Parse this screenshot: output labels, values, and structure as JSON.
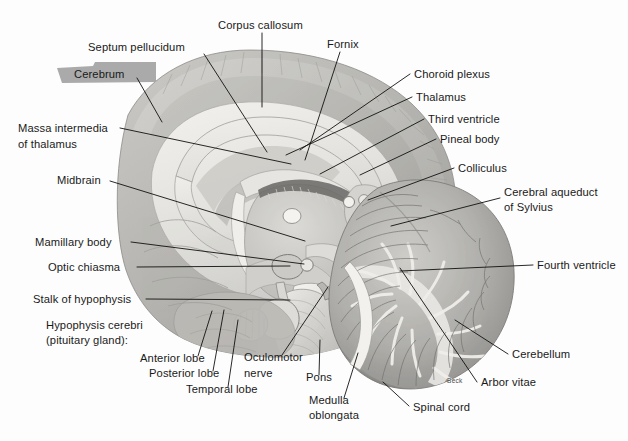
{
  "figure": {
    "signature": "Beck",
    "background_color": "#fdfdfd",
    "line_color": "#111111",
    "text_color": "#1a1a1a",
    "highlight_color": "#a9aaa9",
    "highlighted_label": "Cerebrum"
  },
  "labels": [
    {
      "id": "septum-pellucidum",
      "text": "Septum pellucidum",
      "x": 88,
      "y": 51,
      "anchor": "start"
    },
    {
      "id": "corpus-callosum",
      "text": "Corpus callosum",
      "x": 218,
      "y": 29,
      "anchor": "start"
    },
    {
      "id": "fornix",
      "text": "Fornix",
      "x": 327,
      "y": 48,
      "anchor": "start"
    },
    {
      "id": "cerebrum",
      "text": "Cerebrum",
      "x": 74,
      "y": 78,
      "anchor": "start"
    },
    {
      "id": "choroid-plexus",
      "text": "Choroid plexus",
      "x": 414,
      "y": 78,
      "anchor": "start"
    },
    {
      "id": "thalamus",
      "text": "Thalamus",
      "x": 416,
      "y": 101,
      "anchor": "start"
    },
    {
      "id": "third-ventricle",
      "text": "Third ventricle",
      "x": 428,
      "y": 123,
      "anchor": "start"
    },
    {
      "id": "pineal-body",
      "text": "Pineal body",
      "x": 440,
      "y": 143,
      "anchor": "start"
    },
    {
      "id": "massa-intermedia-1",
      "text": "Massa intermedia",
      "x": 18,
      "y": 132,
      "anchor": "start"
    },
    {
      "id": "massa-intermedia-2",
      "text": "of thalamus",
      "x": 18,
      "y": 148,
      "anchor": "start"
    },
    {
      "id": "colliculus",
      "text": "Colliculus",
      "x": 458,
      "y": 172,
      "anchor": "start"
    },
    {
      "id": "midbrain",
      "text": "Midbrain",
      "x": 57,
      "y": 184,
      "anchor": "start"
    },
    {
      "id": "cerebral-aqueduct-1",
      "text": "Cerebral aqueduct",
      "x": 504,
      "y": 196,
      "anchor": "start"
    },
    {
      "id": "cerebral-aqueduct-2",
      "text": "of Sylvius",
      "x": 504,
      "y": 211,
      "anchor": "start"
    },
    {
      "id": "mamillary-body",
      "text": "Mamillary body",
      "x": 35,
      "y": 246,
      "anchor": "start"
    },
    {
      "id": "fourth-ventricle",
      "text": "Fourth ventricle",
      "x": 537,
      "y": 269,
      "anchor": "start"
    },
    {
      "id": "optic-chiasma",
      "text": "Optic chiasma",
      "x": 48,
      "y": 271,
      "anchor": "start"
    },
    {
      "id": "stalk-of-hypophysis",
      "text": "Stalk of hypophysis",
      "x": 33,
      "y": 303,
      "anchor": "start"
    },
    {
      "id": "hypophysis-1",
      "text": "Hypophysis cerebri",
      "x": 46,
      "y": 329,
      "anchor": "start"
    },
    {
      "id": "hypophysis-2",
      "text": "(pituitary gland):",
      "x": 46,
      "y": 344,
      "anchor": "start"
    },
    {
      "id": "cerebellum",
      "text": "Cerebellum",
      "x": 512,
      "y": 358,
      "anchor": "start"
    },
    {
      "id": "anterior-lobe",
      "text": "Anterior lobe",
      "x": 140,
      "y": 362,
      "anchor": "start"
    },
    {
      "id": "oculomotor-1",
      "text": "Oculomotor",
      "x": 244,
      "y": 361,
      "anchor": "start"
    },
    {
      "id": "posterior-lobe",
      "text": "Posterior lobe",
      "x": 149,
      "y": 377,
      "anchor": "start"
    },
    {
      "id": "oculomotor-2",
      "text": "nerve",
      "x": 244,
      "y": 377,
      "anchor": "start"
    },
    {
      "id": "pons",
      "text": "Pons",
      "x": 306,
      "y": 381,
      "anchor": "start"
    },
    {
      "id": "arbor-vitae",
      "text": "Arbor vitae",
      "x": 481,
      "y": 386,
      "anchor": "start"
    },
    {
      "id": "temporal-lobe",
      "text": "Temporal lobe",
      "x": 186,
      "y": 393,
      "anchor": "start"
    },
    {
      "id": "medulla-1",
      "text": "Medulla",
      "x": 309,
      "y": 404,
      "anchor": "start"
    },
    {
      "id": "spinal-cord",
      "text": "Spinal cord",
      "x": 413,
      "y": 411,
      "anchor": "start"
    },
    {
      "id": "medulla-2",
      "text": "oblongata",
      "x": 309,
      "y": 419,
      "anchor": "start"
    }
  ],
  "leaders": [
    {
      "id": "leader-septum-pellucidum",
      "d": "M204,54 L267,152"
    },
    {
      "id": "leader-corpus-callosum",
      "d": "M262,33 L262,107"
    },
    {
      "id": "leader-fornix",
      "d": "M340,52 L305,160"
    },
    {
      "id": "leader-cerebrum",
      "d": "M137,78 L162,122"
    },
    {
      "id": "leader-choroid-plexus",
      "d": "M410,74 L300,150"
    },
    {
      "id": "leader-thalamus",
      "d": "M412,97 L286,155"
    },
    {
      "id": "leader-third-ventricle",
      "d": "M424,119 L320,174"
    },
    {
      "id": "leader-pineal-body",
      "d": "M436,139 L360,175"
    },
    {
      "id": "leader-massa-intermedia",
      "d": "M120,128 L291,164"
    },
    {
      "id": "leader-colliculus",
      "d": "M454,168 L368,200"
    },
    {
      "id": "leader-midbrain",
      "d": "M110,181 L305,241"
    },
    {
      "id": "leader-cerebral-aqueduct",
      "d": "M500,198 L391,226"
    },
    {
      "id": "leader-mamillary-body",
      "d": "M131,242 L304,264"
    },
    {
      "id": "leader-fourth-ventricle",
      "d": "M533,265 L400,271"
    },
    {
      "id": "leader-optic-chiasma",
      "d": "M137,267 L290,266"
    },
    {
      "id": "leader-stalk-of-hypophysis",
      "d": "M146,299 L290,300"
    },
    {
      "id": "leader-anterior-lobe",
      "d": "M198,356 L212,311"
    },
    {
      "id": "leader-posterior-lobe",
      "d": "M213,371 L224,310"
    },
    {
      "id": "leader-temporal-lobe",
      "d": "M228,387 L238,320"
    },
    {
      "id": "leader-oculomotor-nerve",
      "d": "M282,355 L328,287"
    },
    {
      "id": "leader-pons",
      "d": "M319,375 L320,340"
    },
    {
      "id": "leader-medulla-oblongata",
      "d": "M344,398 L358,353"
    },
    {
      "id": "leader-spinal-cord",
      "d": "M409,406 L383,382"
    },
    {
      "id": "leader-cerebellum",
      "d": "M508,354 L455,320"
    },
    {
      "id": "leader-arbor-vitae",
      "d": "M477,382 L400,268"
    }
  ],
  "highlight": {
    "id": "cerebrum-highlight",
    "d": "M57,68 L93,66 L95,62 L156,62 L156,82 L62,83 Z"
  }
}
